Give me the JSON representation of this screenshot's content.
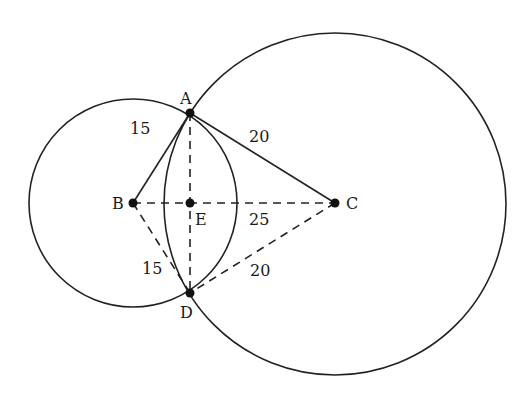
{
  "diagram": {
    "points": {
      "A": {
        "label": "A"
      },
      "B": {
        "label": "B"
      },
      "C": {
        "label": "C"
      },
      "D": {
        "label": "D"
      },
      "E": {
        "label": "E"
      }
    },
    "lengths": {
      "AB": "15",
      "AC": "20",
      "BC": "25",
      "BD": "15",
      "CD": "20"
    },
    "circles": [
      {
        "center": "B",
        "radius_label": "15"
      },
      {
        "center": "C",
        "radius_label": "20"
      }
    ],
    "colors": {
      "stroke": "#222222",
      "background": "#ffffff"
    }
  }
}
